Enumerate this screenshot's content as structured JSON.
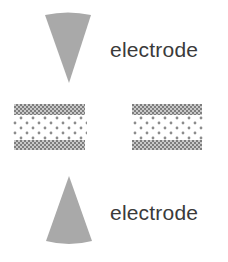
{
  "diagram": {
    "top_electrode": {
      "label": "electrode",
      "shape": "downward-cone",
      "color": "#a9a9a9"
    },
    "bottom_electrode": {
      "label": "electrode",
      "shape": "upward-cone",
      "color": "#a9a9a9"
    },
    "samples": [
      {
        "name": "left-sample",
        "layers": [
          "checkered-band",
          "dotted-core",
          "checkered-band"
        ]
      },
      {
        "name": "right-sample",
        "layers": [
          "checkered-band",
          "dotted-core",
          "checkered-band"
        ]
      }
    ],
    "colors": {
      "band": "#8a8a8a",
      "dot": "#8c8c8c",
      "text": "#3a3a3a"
    }
  }
}
